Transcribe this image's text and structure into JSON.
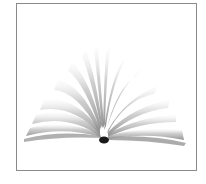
{
  "image": {
    "subject": "open book with fanned pages",
    "frame_color": "#8a8a8a",
    "background": "#ffffff",
    "page_color": "#9a9a9a",
    "spine_color": "#1a1a1a"
  }
}
